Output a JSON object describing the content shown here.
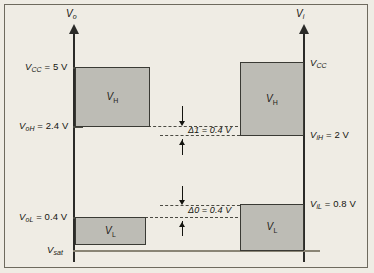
{
  "figure": {
    "title_none": "",
    "axes": {
      "left_axis_label": "V",
      "left_axis_sub": "o",
      "right_axis_label": "V",
      "right_axis_sub": "i"
    },
    "left_labels": [
      {
        "name": "vcc",
        "text": "V",
        "sub": "CC",
        "value": " = 5 V"
      },
      {
        "name": "voh",
        "text": "V",
        "sub": "oH",
        "value": " = 2.4 V"
      },
      {
        "name": "vol",
        "text": "V",
        "sub": "oL",
        "value": " = 0.4 V"
      },
      {
        "name": "vsat",
        "text": "V",
        "sub": "sat",
        "value": ""
      }
    ],
    "right_labels": [
      {
        "name": "vcc",
        "text": "V",
        "sub": "CC",
        "value": ""
      },
      {
        "name": "vih",
        "text": "V",
        "sub": "iH",
        "value": " = 2 V"
      },
      {
        "name": "vil",
        "text": "V",
        "sub": "iL",
        "value": " = 0.8 V"
      }
    ],
    "blocks": [
      {
        "name": "output-high-block",
        "text": "V",
        "sub": "H"
      },
      {
        "name": "input-high-block",
        "text": "V",
        "sub": "H"
      },
      {
        "name": "output-low-block",
        "text": "V",
        "sub": "L"
      },
      {
        "name": "input-low-block",
        "text": "V",
        "sub": "L"
      }
    ],
    "annotations": [
      {
        "name": "delta-one",
        "text": "Δ1 = 0.4 V"
      },
      {
        "name": "delta-zero",
        "text": "Δ0 = 0.4 V"
      }
    ],
    "colors": {
      "background": "#efece4",
      "block_fill": "#bdbcb5",
      "block_stroke": "#3a3a34",
      "axis": "#2b2b28",
      "baseline": "#8a8575",
      "text": "#14140f"
    }
  }
}
